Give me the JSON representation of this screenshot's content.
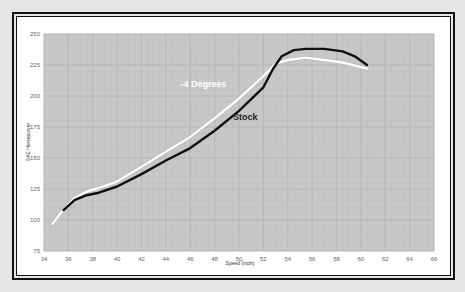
{
  "chart_data": {
    "type": "line",
    "title": "",
    "xlabel": "Speed (mph)",
    "ylabel": "SAE Horsepower",
    "xlim": [
      34,
      66
    ],
    "ylim": [
      75,
      250
    ],
    "x_ticks": [
      34,
      36,
      38,
      40,
      42,
      44,
      46,
      48,
      50,
      52,
      54,
      56,
      58,
      60,
      62,
      64,
      66
    ],
    "y_ticks": [
      75,
      100,
      125,
      150,
      175,
      200,
      225,
      250
    ],
    "grid": true,
    "legend_position": "inline labels",
    "series": [
      {
        "name": "Stock",
        "color": "#111111",
        "label_pos": {
          "x": 49.5,
          "y": 181
        },
        "points": [
          [
            35.6,
            108
          ],
          [
            36.5,
            116
          ],
          [
            37.5,
            120
          ],
          [
            38.5,
            122
          ],
          [
            40,
            127
          ],
          [
            42,
            137
          ],
          [
            44,
            148
          ],
          [
            46,
            158
          ],
          [
            48,
            172
          ],
          [
            50,
            188
          ],
          [
            52,
            207
          ],
          [
            52.8,
            222
          ],
          [
            53.5,
            232
          ],
          [
            54.5,
            237
          ],
          [
            55.5,
            238
          ],
          [
            57,
            238
          ],
          [
            58.5,
            236
          ],
          [
            59.5,
            232
          ],
          [
            60.5,
            225
          ]
        ]
      },
      {
        "name": "-4 Degrees",
        "color": "#ffffff",
        "label_pos": {
          "x": 45.2,
          "y": 207
        },
        "points": [
          [
            34.7,
            97
          ],
          [
            35.5,
            107
          ],
          [
            36.5,
            118
          ],
          [
            37.5,
            123
          ],
          [
            38.5,
            126
          ],
          [
            40,
            131
          ],
          [
            42,
            143
          ],
          [
            44,
            155
          ],
          [
            46,
            167
          ],
          [
            48,
            182
          ],
          [
            50,
            198
          ],
          [
            52,
            216
          ],
          [
            53,
            226
          ],
          [
            54,
            229
          ],
          [
            55.5,
            231
          ],
          [
            57,
            229
          ],
          [
            58.5,
            227
          ],
          [
            60.5,
            222
          ]
        ]
      }
    ]
  },
  "colors": {
    "plot_background": "#c8c8c8",
    "grid_major": "#b4b4b4",
    "grid_minor": "#bebebe",
    "page_background": "#e6e6e6",
    "frame": "#111111"
  }
}
